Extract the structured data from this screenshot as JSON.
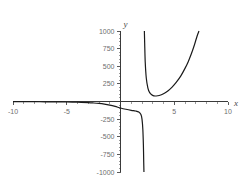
{
  "chart_data": {
    "type": "line",
    "title": "",
    "xlabel": "x",
    "ylabel": "y",
    "xlim": [
      -10,
      10
    ],
    "ylim": [
      -1000,
      1000
    ],
    "grid": false,
    "legend": null,
    "x_ticks": [
      -10,
      -5,
      5,
      10
    ],
    "x_tick_labels": [
      "-10",
      "-5",
      "5",
      "10"
    ],
    "y_ticks": [
      1000,
      750,
      500,
      250,
      -250,
      -500,
      -750,
      -1000
    ],
    "y_tick_labels": [
      "1000",
      "750",
      "500",
      "250",
      "-250",
      "-500",
      "-750",
      "-1000"
    ],
    "x_minor_tick_step": 1,
    "y_minor_tick_step": 50,
    "axis_color": "#3a3a3a",
    "curve_color": "#1a1a1a",
    "tick_label_color": "#6e6e6e",
    "background": "#ffffff",
    "vertical_asymptote_x": 2.2,
    "series": [
      {
        "name": "branch-left",
        "comment": "Left branch: approaches 0 from below for x << 0, dives to -1000 just left of the asymptote",
        "x": [
          -10,
          -9,
          -8,
          -7,
          -6,
          -5,
          -4,
          -3,
          -2.5,
          -2,
          -1.5,
          -1,
          -0.5,
          0,
          0.5,
          1,
          1.4,
          1.7,
          1.9,
          2.0,
          2.08,
          2.13,
          2.16,
          2.18
        ],
        "y": [
          -2,
          -2,
          -3,
          -4,
          -5,
          -7,
          -10,
          -16,
          -21,
          -28,
          -38,
          -52,
          -70,
          -92,
          -110,
          -125,
          -135,
          -150,
          -185,
          -250,
          -400,
          -620,
          -860,
          -1000
        ]
      },
      {
        "name": "branch-right",
        "comment": "Right branch: falls from +1000 at the asymptote to a shallow minimum near x=3.2, then grows steeply to +1000 near x=7.3",
        "x": [
          2.22,
          2.25,
          2.3,
          2.4,
          2.55,
          2.7,
          2.9,
          3.1,
          3.3,
          3.6,
          4.0,
          4.4,
          4.8,
          5.2,
          5.6,
          6.0,
          6.3,
          6.6,
          6.85,
          7.05,
          7.2,
          7.3
        ],
        "y": [
          1000,
          820,
          560,
          330,
          190,
          130,
          95,
          80,
          78,
          85,
          110,
          150,
          205,
          275,
          360,
          470,
          565,
          680,
          790,
          890,
          960,
          1000
        ]
      }
    ],
    "annotations": []
  }
}
